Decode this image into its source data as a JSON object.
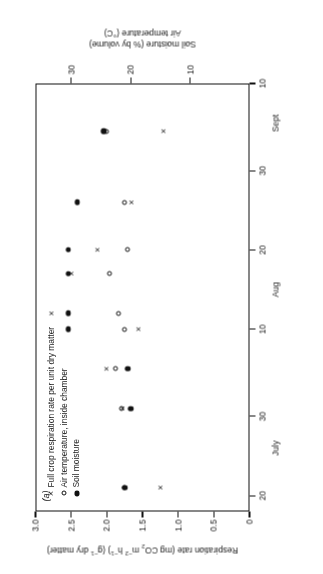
{
  "figure": {
    "panel_label": "(a)",
    "orientation_note": "rotated-180"
  },
  "legend": {
    "items": [
      {
        "marker": "cross-marker",
        "label": "Full crop respiration rate per unit dry matter"
      },
      {
        "marker": "open-circle-marker",
        "label": "Air temperature, inside chamber"
      },
      {
        "marker": "filled-circle-marker",
        "label": "Soil moisture"
      }
    ]
  },
  "chart_data": {
    "type": "scatter",
    "title": "",
    "xlabel": "",
    "ylabel": "Respiration rate (mg CO2 m-2 h-1) (g-1 dry matter)",
    "ylabel_parts": {
      "a": "Respiration rate (mg CO",
      "a_sub": "2",
      "b": " m",
      "b_sup": "−2",
      "c": " h",
      "c_sup": "−1",
      "d": ") (g",
      "d_sup": "−1",
      "e": " dry matter)"
    },
    "y2label_line1": "Soil moisture (% by volume)",
    "y2label_line2": "Air temperature (°C)",
    "xlim": [
      18,
      72
    ],
    "x_ticks": [
      {
        "value": 20,
        "label": "20"
      },
      {
        "value": 30,
        "label": "30"
      },
      {
        "value": 41,
        "label": "10"
      },
      {
        "value": 51,
        "label": "20"
      },
      {
        "value": 61,
        "label": "30"
      },
      {
        "value": 72,
        "label": "10"
      }
    ],
    "x_month_labels": [
      {
        "value": 26,
        "label": "July"
      },
      {
        "value": 46,
        "label": "Aug"
      },
      {
        "value": 67,
        "label": "Sept"
      }
    ],
    "ylim": [
      0,
      3.0
    ],
    "y_ticks": [
      {
        "value": 0,
        "label": "0"
      },
      {
        "value": 0.5,
        "label": "0.5"
      },
      {
        "value": 1.0,
        "label": "1.0"
      },
      {
        "value": 1.5,
        "label": "1.5"
      },
      {
        "value": 2.0,
        "label": "2.0"
      },
      {
        "value": 2.5,
        "label": "2.5"
      },
      {
        "value": 3.0,
        "label": "3.0"
      }
    ],
    "y2lim": [
      0,
      36
    ],
    "y2_ticks": [
      {
        "value": 10,
        "label": "10"
      },
      {
        "value": 20,
        "label": "20"
      },
      {
        "value": 30,
        "label": "30"
      }
    ],
    "series": [
      {
        "name": "Full crop respiration rate per unit dry matter",
        "marker": "cross-marker",
        "axis": "left",
        "points": [
          {
            "x": 21,
            "y": 1.25
          },
          {
            "x": 31,
            "y": 1.78
          },
          {
            "x": 36,
            "y": 2.0
          },
          {
            "x": 41,
            "y": 1.55
          },
          {
            "x": 43,
            "y": 2.78
          },
          {
            "x": 48,
            "y": 2.5
          },
          {
            "x": 51,
            "y": 2.13
          },
          {
            "x": 57,
            "y": 1.65
          },
          {
            "x": 66,
            "y": 1.2
          }
        ]
      },
      {
        "name": "Air temperature, inside chamber",
        "marker": "open-circle-marker",
        "axis": "right",
        "points": [
          {
            "x": 21,
            "y": 21.0
          },
          {
            "x": 31,
            "y": 21.5
          },
          {
            "x": 36,
            "y": 22.5
          },
          {
            "x": 41,
            "y": 21.0
          },
          {
            "x": 43,
            "y": 22.0
          },
          {
            "x": 48,
            "y": 23.5
          },
          {
            "x": 51,
            "y": 20.5
          },
          {
            "x": 57,
            "y": 21.0
          },
          {
            "x": 66,
            "y": 24.0
          }
        ]
      },
      {
        "name": "Soil moisture",
        "marker": "filled-circle-marker",
        "axis": "right",
        "points": [
          {
            "x": 21,
            "y": 21.0
          },
          {
            "x": 31,
            "y": 20.0
          },
          {
            "x": 36,
            "y": 20.5
          },
          {
            "x": 41,
            "y": 30.5
          },
          {
            "x": 43,
            "y": 30.5
          },
          {
            "x": 48,
            "y": 30.5
          },
          {
            "x": 51,
            "y": 30.5
          },
          {
            "x": 57,
            "y": 29.0
          },
          {
            "x": 66,
            "y": 24.5
          }
        ]
      }
    ],
    "grid": false,
    "legend_position": "upper-left-inside"
  }
}
